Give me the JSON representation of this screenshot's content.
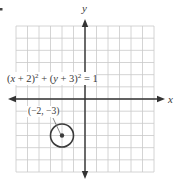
{
  "figure": {
    "marker": ".",
    "axes": {
      "x_label": "x",
      "y_label": "y",
      "x_range": [
        -6,
        6
      ],
      "y_range": [
        -6,
        6
      ],
      "grid": true,
      "grid_step": 1
    },
    "equation": {
      "parts": [
        "(",
        "x",
        " + 2)",
        "2",
        " + (",
        "y",
        " + 3)",
        "2",
        " = 1"
      ],
      "text": "(x + 2)² + (y + 3)² = 1"
    },
    "circle": {
      "center": [
        -2,
        -3
      ],
      "radius": 1,
      "center_label": "(−2, −3)"
    },
    "colors": {
      "grid": "#c9c9c9",
      "axis": "#333333",
      "circle": "#3a3a3a",
      "text": "#3a3a3a"
    }
  }
}
